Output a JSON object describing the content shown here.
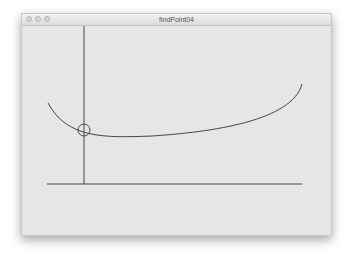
{
  "window": {
    "title": "findPoint04",
    "controls": [
      "close",
      "minimize",
      "zoom"
    ]
  },
  "sketch": {
    "background": "#e6e6e6",
    "stroke": "#444444",
    "vertical_line": {
      "x": 62,
      "y1": 0,
      "y2": 158
    },
    "horizontal_line": {
      "y": 158,
      "x1": 25,
      "x2": 280
    },
    "curve_path": "M26,77 C45,112 80,112 130,110 C190,106 270,95 280,58",
    "marker_circle": {
      "cx": 62,
      "cy": 104,
      "r": 6
    }
  }
}
